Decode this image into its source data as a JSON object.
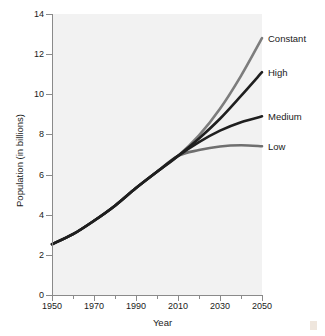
{
  "chart_data": {
    "type": "line",
    "title": "",
    "xlabel": "Year",
    "ylabel": "Population (in billions)",
    "xlim": [
      1950,
      2050
    ],
    "ylim": [
      0,
      14
    ],
    "grid": false,
    "legend_position": "inline-right",
    "x_ticks": [
      1950,
      1970,
      1990,
      2010,
      2030,
      2050
    ],
    "x_tick_labels": [
      "1950",
      "1970",
      "1990",
      "2010",
      "2030",
      "2050"
    ],
    "x_minor_ticks": [
      1960,
      1980,
      2000,
      2020,
      2040
    ],
    "y_ticks": [
      0,
      2,
      4,
      6,
      8,
      10,
      12,
      14
    ],
    "y_tick_labels": [
      "0",
      "2",
      "4",
      "6",
      "8",
      "10",
      "12",
      "14"
    ],
    "x": [
      1950,
      1960,
      1970,
      1980,
      1990,
      2000,
      2010,
      2020,
      2030,
      2040,
      2050
    ],
    "series": [
      {
        "name": "Constant",
        "color": "#7d7d7d",
        "label_value": 12.8,
        "values": [
          2.53,
          3.03,
          3.7,
          4.45,
          5.33,
          6.14,
          6.93,
          7.95,
          9.28,
          10.92,
          12.8
        ]
      },
      {
        "name": "High",
        "color": "#1f1f1f",
        "label_value": 11.1,
        "values": [
          2.53,
          3.03,
          3.7,
          4.45,
          5.33,
          6.14,
          6.93,
          7.8,
          8.78,
          9.92,
          11.1
        ]
      },
      {
        "name": "Medium",
        "color": "#1f1f1f",
        "label_value": 8.9,
        "values": [
          2.53,
          3.03,
          3.7,
          4.45,
          5.33,
          6.14,
          6.93,
          7.62,
          8.19,
          8.61,
          8.9
        ]
      },
      {
        "name": "Low",
        "color": "#6f6f6f",
        "label_value": 7.4,
        "values": [
          2.53,
          3.03,
          3.7,
          4.45,
          5.33,
          6.14,
          6.93,
          7.22,
          7.4,
          7.46,
          7.41
        ]
      }
    ]
  },
  "labels": {
    "constant": "Constant",
    "high": "High",
    "medium": "Medium",
    "low": "Low"
  },
  "axis": {
    "x_title": "Year",
    "y_title": "Population (in billions)"
  },
  "colors": {
    "plot_background": "#f2f2f2",
    "axis": "#8a8a8a",
    "text": "#1a1a1a",
    "constant": "#7d7d7d",
    "high": "#1f1f1f",
    "medium": "#1f1f1f",
    "low": "#6f6f6f"
  }
}
